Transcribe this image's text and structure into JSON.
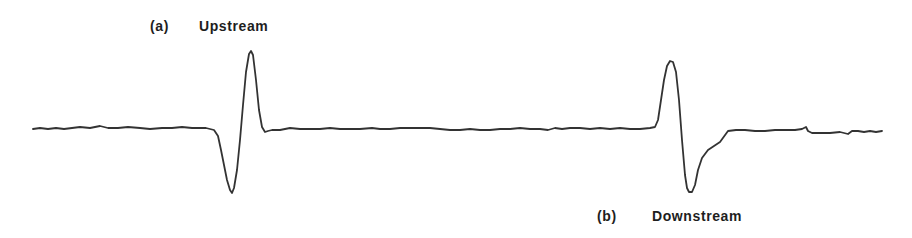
{
  "chart_data": {
    "type": "line",
    "title": "",
    "xlabel": "",
    "ylabel": "",
    "grid": false,
    "axes_visible": false,
    "line_color": "#333333",
    "annotations": [
      {
        "tag": "(a)",
        "text": "Upstream",
        "position": "above first pulse"
      },
      {
        "tag": "(b)",
        "text": "Downstream",
        "position": "below second pulse"
      }
    ],
    "series": [
      {
        "name": "signal trace",
        "points_px": [
          [
            33,
            129
          ],
          [
            40,
            128
          ],
          [
            48,
            129
          ],
          [
            56,
            128
          ],
          [
            64,
            129
          ],
          [
            72,
            128
          ],
          [
            80,
            127
          ],
          [
            90,
            128
          ],
          [
            100,
            126
          ],
          [
            108,
            128
          ],
          [
            118,
            128
          ],
          [
            128,
            127
          ],
          [
            140,
            128
          ],
          [
            150,
            129
          ],
          [
            162,
            128
          ],
          [
            172,
            128
          ],
          [
            182,
            127
          ],
          [
            192,
            128
          ],
          [
            206,
            128
          ],
          [
            214,
            130
          ],
          [
            218,
            136
          ],
          [
            221,
            150
          ],
          [
            224,
            165
          ],
          [
            227,
            180
          ],
          [
            230,
            190
          ],
          [
            232,
            193
          ],
          [
            234,
            188
          ],
          [
            237,
            170
          ],
          [
            240,
            140
          ],
          [
            243,
            105
          ],
          [
            246,
            72
          ],
          [
            249,
            54
          ],
          [
            251,
            51
          ],
          [
            253,
            55
          ],
          [
            256,
            80
          ],
          [
            259,
            110
          ],
          [
            262,
            127
          ],
          [
            265,
            132
          ],
          [
            268,
            131
          ],
          [
            272,
            130
          ],
          [
            280,
            130
          ],
          [
            290,
            128
          ],
          [
            300,
            129
          ],
          [
            310,
            129
          ],
          [
            320,
            129
          ],
          [
            330,
            128
          ],
          [
            340,
            129
          ],
          [
            350,
            129
          ],
          [
            360,
            129
          ],
          [
            372,
            128
          ],
          [
            380,
            129
          ],
          [
            390,
            129
          ],
          [
            400,
            128
          ],
          [
            412,
            128
          ],
          [
            420,
            128
          ],
          [
            430,
            128
          ],
          [
            440,
            129
          ],
          [
            450,
            130
          ],
          [
            460,
            130
          ],
          [
            470,
            129
          ],
          [
            480,
            130
          ],
          [
            490,
            130
          ],
          [
            500,
            129
          ],
          [
            510,
            129
          ],
          [
            520,
            128
          ],
          [
            530,
            129
          ],
          [
            540,
            129
          ],
          [
            548,
            130
          ],
          [
            555,
            128
          ],
          [
            562,
            129
          ],
          [
            570,
            128
          ],
          [
            580,
            128
          ],
          [
            590,
            129
          ],
          [
            600,
            128
          ],
          [
            610,
            129
          ],
          [
            620,
            128
          ],
          [
            630,
            129
          ],
          [
            640,
            129
          ],
          [
            650,
            128
          ],
          [
            655,
            127
          ],
          [
            658,
            120
          ],
          [
            661,
            100
          ],
          [
            664,
            80
          ],
          [
            667,
            66
          ],
          [
            670,
            61
          ],
          [
            673,
            62
          ],
          [
            676,
            72
          ],
          [
            679,
            100
          ],
          [
            682,
            140
          ],
          [
            685,
            175
          ],
          [
            687,
            188
          ],
          [
            689,
            192
          ],
          [
            692,
            192
          ],
          [
            695,
            185
          ],
          [
            698,
            170
          ],
          [
            702,
            158
          ],
          [
            708,
            150
          ],
          [
            714,
            146
          ],
          [
            720,
            142
          ],
          [
            728,
            131
          ],
          [
            736,
            130
          ],
          [
            745,
            130
          ],
          [
            755,
            131
          ],
          [
            765,
            131
          ],
          [
            775,
            130
          ],
          [
            785,
            130
          ],
          [
            795,
            130
          ],
          [
            802,
            129
          ],
          [
            806,
            127
          ],
          [
            808,
            131
          ],
          [
            812,
            133
          ],
          [
            820,
            133
          ],
          [
            830,
            133
          ],
          [
            840,
            132
          ],
          [
            848,
            134
          ],
          [
            852,
            131
          ],
          [
            858,
            131
          ],
          [
            864,
            132
          ],
          [
            870,
            131
          ],
          [
            876,
            132
          ],
          [
            882,
            131
          ]
        ]
      }
    ],
    "pulses": [
      {
        "label": "(a) Upstream",
        "center_x_px": 242,
        "peak_y_px": 51,
        "trough_y_px": 193,
        "order": "trough then peak"
      },
      {
        "label": "(b) Downstream",
        "center_x_px": 680,
        "peak_y_px": 61,
        "trough_y_px": 192,
        "order": "peak then trough"
      }
    ]
  },
  "labels": {
    "a_tag": "(a)",
    "a_text": "Upstream",
    "b_tag": "(b)",
    "b_text": "Downstream"
  }
}
